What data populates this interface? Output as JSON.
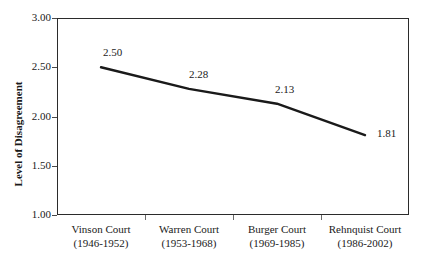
{
  "chart_data": {
    "type": "line",
    "title": "",
    "xlabel": "",
    "ylabel": "Level of Disagreement",
    "categories": [
      "Vinson Court",
      "Warren Court",
      "Burger Court",
      "Rehnquist Court"
    ],
    "category_years": [
      "(1946-1952)",
      "(1953-1968)",
      "(1969-1985)",
      "(1986-2002)"
    ],
    "category_labels_full": [
      "Vinson Court (1946-1952)",
      "Warren Court (1953-1968)",
      "Burger Court (1969-1985)",
      "Rehnquist Court (1986-2002)"
    ],
    "values": [
      2.5,
      2.28,
      2.13,
      1.81
    ],
    "point_labels": [
      "2.50",
      "2.28",
      "2.13",
      "1.81"
    ],
    "ylim": [
      1.0,
      3.0
    ],
    "ytick_values": [
      3.0,
      2.5,
      2.0,
      1.5,
      1.0
    ],
    "ytick_labels": [
      "3.00",
      "2.50",
      "2.00",
      "1.50",
      "1.00"
    ],
    "grid": false,
    "legend": false,
    "legend_position": "none",
    "series": [
      {
        "name": "Level of Disagreement",
        "values": [
          2.5,
          2.28,
          2.13,
          1.81
        ]
      }
    ],
    "line_color": "#1a1a1a",
    "axis_color": "#2b2b2b",
    "background_color": "#ffffff"
  },
  "axis": {
    "y_title": "Level of Disagreement"
  }
}
